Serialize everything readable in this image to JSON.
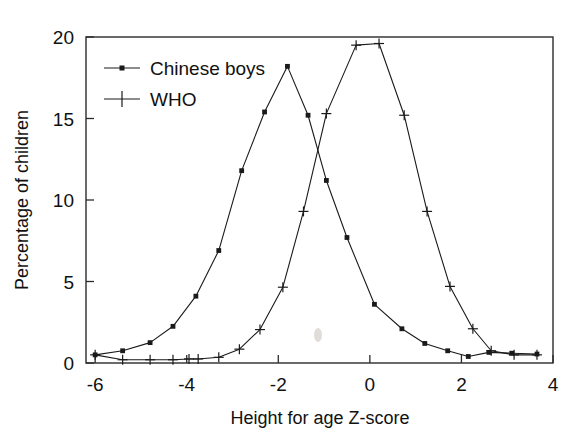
{
  "chart_data": {
    "type": "line",
    "title": "",
    "xlabel": "Height for age Z-score",
    "ylabel": "Percentage of children",
    "xlim": [
      -6.2,
      4.0
    ],
    "ylim": [
      0,
      20
    ],
    "xticks": [
      -6,
      -4,
      -2,
      0,
      2,
      4
    ],
    "xtick_labels": [
      "-6",
      "-4",
      "-2",
      "0",
      "2",
      "4"
    ],
    "yticks": [
      0,
      5,
      10,
      15,
      20
    ],
    "ytick_labels": [
      "0",
      "5",
      "10",
      "15",
      "20"
    ],
    "grid": false,
    "legend_position": "top-left",
    "series": [
      {
        "name": "Chinese boys",
        "marker": "square",
        "points": [
          {
            "x": -6.0,
            "y": 0.5
          },
          {
            "x": -5.4,
            "y": 0.75
          },
          {
            "x": -4.8,
            "y": 1.25
          },
          {
            "x": -4.3,
            "y": 2.25
          },
          {
            "x": -3.8,
            "y": 4.1
          },
          {
            "x": -3.3,
            "y": 6.9
          },
          {
            "x": -2.8,
            "y": 11.8
          },
          {
            "x": -2.3,
            "y": 15.4
          },
          {
            "x": -1.8,
            "y": 18.2
          },
          {
            "x": -1.35,
            "y": 15.2
          },
          {
            "x": -0.95,
            "y": 11.2
          },
          {
            "x": -0.5,
            "y": 7.7
          },
          {
            "x": 0.1,
            "y": 3.6
          },
          {
            "x": 0.7,
            "y": 2.1
          },
          {
            "x": 1.2,
            "y": 1.2
          },
          {
            "x": 1.7,
            "y": 0.75
          },
          {
            "x": 2.15,
            "y": 0.4
          },
          {
            "x": 2.6,
            "y": 0.65
          },
          {
            "x": 3.1,
            "y": 0.6
          },
          {
            "x": 3.65,
            "y": 0.55
          }
        ]
      },
      {
        "name": "WHO",
        "marker": "plus",
        "points": [
          {
            "x": -6.0,
            "y": 0.5
          },
          {
            "x": -5.4,
            "y": 0.2
          },
          {
            "x": -4.8,
            "y": 0.2
          },
          {
            "x": -4.3,
            "y": 0.2
          },
          {
            "x": -3.95,
            "y": 0.25
          },
          {
            "x": -3.75,
            "y": 0.25
          },
          {
            "x": -3.3,
            "y": 0.35
          },
          {
            "x": -2.85,
            "y": 0.85
          },
          {
            "x": -2.4,
            "y": 2.05
          },
          {
            "x": -1.9,
            "y": 4.65
          },
          {
            "x": -1.45,
            "y": 9.3
          },
          {
            "x": -0.95,
            "y": 15.3
          },
          {
            "x": -0.3,
            "y": 19.5
          },
          {
            "x": 0.2,
            "y": 19.6
          },
          {
            "x": 0.75,
            "y": 15.2
          },
          {
            "x": 1.25,
            "y": 9.3
          },
          {
            "x": 1.75,
            "y": 4.7
          },
          {
            "x": 2.25,
            "y": 2.1
          },
          {
            "x": 2.65,
            "y": 0.75
          },
          {
            "x": 3.15,
            "y": 0.5
          },
          {
            "x": 3.65,
            "y": 0.5
          }
        ]
      }
    ]
  },
  "legend": {
    "items": [
      {
        "label": "Chinese boys",
        "marker": "square"
      },
      {
        "label": "WHO",
        "marker": "plus"
      }
    ]
  },
  "axes": {
    "x_title": "Height for age Z-score",
    "y_title": "Percentage of children"
  }
}
